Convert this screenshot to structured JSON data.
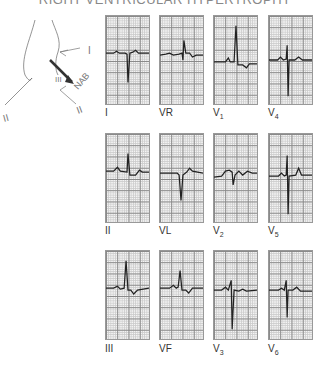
{
  "title": "RIGHT VENTRICULAR HYPERTROPHY",
  "annotation": {
    "handwritten_labels": [
      "I",
      "II",
      "III",
      "NAB"
    ]
  },
  "leads": [
    {
      "id": "I",
      "label": "I",
      "sub": "",
      "row": 0,
      "col": 0
    },
    {
      "id": "VR",
      "label": "VR",
      "sub": "",
      "row": 0,
      "col": 1
    },
    {
      "id": "V1",
      "label": "V",
      "sub": "1",
      "row": 0,
      "col": 2
    },
    {
      "id": "V4",
      "label": "V",
      "sub": "4",
      "row": 0,
      "col": 3
    },
    {
      "id": "II",
      "label": "II",
      "sub": "",
      "row": 1,
      "col": 0
    },
    {
      "id": "VL",
      "label": "VL",
      "sub": "",
      "row": 1,
      "col": 1
    },
    {
      "id": "V2",
      "label": "V",
      "sub": "2",
      "row": 1,
      "col": 2
    },
    {
      "id": "V5",
      "label": "V",
      "sub": "5",
      "row": 1,
      "col": 3
    },
    {
      "id": "III",
      "label": "III",
      "sub": "",
      "row": 2,
      "col": 0
    },
    {
      "id": "VF",
      "label": "VF",
      "sub": "",
      "row": 2,
      "col": 1
    },
    {
      "id": "V3",
      "label": "V",
      "sub": "3",
      "row": 2,
      "col": 2
    },
    {
      "id": "V6",
      "label": "V",
      "sub": "6",
      "row": 2,
      "col": 3
    }
  ]
}
